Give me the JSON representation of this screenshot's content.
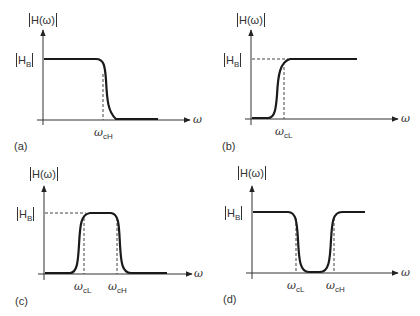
{
  "figure": {
    "panels": [
      {
        "id": "a",
        "tag": "(a)",
        "type": "low-pass",
        "y_label": "H(ω)",
        "level_label": "H",
        "level_sub": "B",
        "x_label": "ω",
        "cutoffs": [
          {
            "sym": "ω",
            "sub": "cH"
          }
        ]
      },
      {
        "id": "b",
        "tag": "(b)",
        "type": "high-pass",
        "y_label": "H(ω)",
        "level_label": "H",
        "level_sub": "B",
        "x_label": "ω",
        "cutoffs": [
          {
            "sym": "ω",
            "sub": "cL"
          }
        ]
      },
      {
        "id": "c",
        "tag": "(c)",
        "type": "band-pass",
        "y_label": "H(ω)",
        "level_label": "H",
        "level_sub": "B",
        "x_label": "ω",
        "cutoffs": [
          {
            "sym": "ω",
            "sub": "cL"
          },
          {
            "sym": "ω",
            "sub": "cH"
          }
        ]
      },
      {
        "id": "d",
        "tag": "(d)",
        "type": "band-stop",
        "y_label": "H(ω)",
        "level_label": "H",
        "level_sub": "B",
        "x_label": "ω",
        "cutoffs": [
          {
            "sym": "ω",
            "sub": "cL"
          },
          {
            "sym": "ω",
            "sub": "cH"
          }
        ]
      }
    ],
    "colors": {
      "curve": "#1a1a1a",
      "axis": "#333333",
      "dashed": "#444444"
    }
  }
}
